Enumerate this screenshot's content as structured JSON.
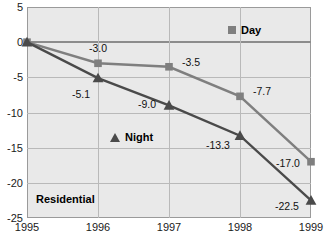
{
  "chart_data": {
    "type": "line",
    "title": "",
    "xlabel": "",
    "ylabel": "",
    "categories": [
      "1995",
      "1996",
      "1997",
      "1998",
      "1999"
    ],
    "x": [
      1995,
      1996,
      1997,
      1998,
      1999
    ],
    "xlim": [
      1995,
      1999
    ],
    "ylim": [
      -25,
      5
    ],
    "yticks": [
      5,
      0,
      -5,
      -10,
      -15,
      -20,
      -25
    ],
    "ytick_labels": [
      "5",
      "0",
      "-5",
      "-10",
      "-15",
      "-20",
      "-25"
    ],
    "grid": true,
    "legend_position": "inside",
    "series": [
      {
        "name": "Day",
        "marker": "square",
        "color": "#7f7f7f",
        "values": [
          0.0,
          -3.0,
          -3.5,
          -7.7,
          -17.0
        ],
        "labels": [
          "",
          "-3.0",
          "-3.5",
          "-7.7",
          "-17.0"
        ]
      },
      {
        "name": "Night",
        "marker": "triangle",
        "color": "#4a4a4a",
        "values": [
          0.0,
          -5.1,
          -9.0,
          -13.3,
          -22.5
        ],
        "labels": [
          "",
          "-5.1",
          "-9.0",
          "-13.3",
          "-22.5"
        ]
      }
    ],
    "annotations": [
      {
        "text": "Residential",
        "x": 1995.25,
        "y": -21.6
      }
    ],
    "legend": [
      {
        "label": "Day",
        "marker": "square",
        "color": "#7f7f7f"
      },
      {
        "label": "Night",
        "marker": "triangle",
        "color": "#4a4a4a"
      }
    ],
    "colors": {
      "day": "#7f7f7f",
      "night": "#4a4a4a",
      "plot_background": "#e9e9e9",
      "gridline": "#b9b9b9",
      "axis": "#9a9a9a",
      "zero_line": "#8c8c8c"
    }
  }
}
